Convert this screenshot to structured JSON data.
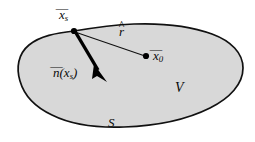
{
  "figure": {
    "name": "closed-surface-volume-diagram",
    "background_color": "#ffffff",
    "region_fill_color": "#d8d8d8",
    "outline_color": "#111111"
  },
  "labels": {
    "surface_point": {
      "base": "x",
      "accent": "¯",
      "subscript": "s",
      "text": "x̄ₛ"
    },
    "unit_vector": {
      "base": "r",
      "accent": "^",
      "subscript": "",
      "text": "r̂"
    },
    "field_point": {
      "base": "x",
      "accent": "¯",
      "subscript": "0",
      "text": "x̄0"
    },
    "normal_vector": {
      "prefix": "n",
      "accent": "¯",
      "open_paren": "(",
      "arg_base": "x",
      "arg_subscript": "s",
      "close_paren": ")",
      "text": "n̄(xₛ)"
    },
    "volume": {
      "text": "V"
    },
    "surface": {
      "text": "S"
    }
  },
  "markers": {
    "surface_point_dot": {
      "cx": 74,
      "cy": 31,
      "r": 3.1
    },
    "field_point_dot": {
      "cx": 146,
      "cy": 56,
      "r": 3.1
    }
  },
  "vectors": {
    "r_hat_line": {
      "x1": 75,
      "y1": 32,
      "x2": 145,
      "y2": 56
    },
    "normal_arrow": {
      "x1": 76,
      "y1": 33,
      "x2": 101,
      "y2": 75
    }
  }
}
